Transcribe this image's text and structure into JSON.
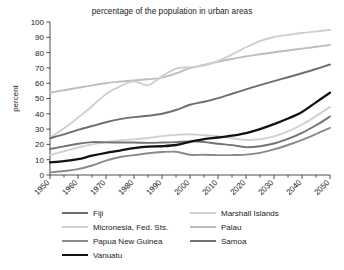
{
  "chart_data": {
    "type": "line",
    "title": "percentage of the population in urban areas",
    "xlabel": "",
    "ylabel": "percent",
    "xlim": [
      1950,
      2050
    ],
    "ylim": [
      0,
      100
    ],
    "ytick_step": 10,
    "xtick_step": 10,
    "minor_xtick_step": 5,
    "grid": false,
    "legend_position": "bottom",
    "yticks": [
      "0",
      "10",
      "20",
      "30",
      "40",
      "50",
      "60",
      "70",
      "80",
      "90",
      "100"
    ],
    "xticks": [
      "1950",
      "1960",
      "1970",
      "1980",
      "1990",
      "2000",
      "2010",
      "2020",
      "2030",
      "2040",
      "2050"
    ],
    "x": [
      1950,
      1955,
      1960,
      1965,
      1970,
      1975,
      1980,
      1985,
      1990,
      1995,
      2000,
      2005,
      2010,
      2015,
      2020,
      2025,
      2030,
      2035,
      2040,
      2045,
      2050
    ],
    "series": [
      {
        "name": "Fiji",
        "color": "#6e6e6e",
        "values": [
          24.0,
          26.5,
          29.5,
          32.0,
          34.5,
          36.5,
          37.8,
          38.7,
          40.0,
          42.5,
          45.9,
          47.9,
          50.3,
          53.1,
          56.0,
          58.8,
          61.4,
          63.9,
          66.5,
          69.3,
          72.2
        ]
      },
      {
        "name": "Micronesia, Fed. Sts.",
        "color": "#d0d0d0",
        "values": [
          13.0,
          15.5,
          18.0,
          20.0,
          21.5,
          22.5,
          23.3,
          24.2,
          25.4,
          26.2,
          26.6,
          26.0,
          25.4,
          24.0,
          22.9,
          23.4,
          25.2,
          28.5,
          33.0,
          38.5,
          44.5
        ]
      },
      {
        "name": "Papua New Guinea",
        "color": "#8a8a8a",
        "values": [
          1.7,
          2.6,
          3.8,
          6.2,
          9.4,
          11.8,
          13.0,
          14.2,
          15.0,
          15.2,
          13.2,
          13.2,
          13.0,
          13.0,
          13.3,
          14.5,
          16.7,
          19.6,
          23.0,
          26.8,
          30.8
        ]
      },
      {
        "name": "Vanuatu",
        "color": "#111111",
        "values": [
          8.3,
          9.0,
          10.3,
          12.6,
          14.5,
          16.0,
          17.5,
          18.5,
          18.8,
          19.6,
          21.7,
          23.5,
          24.5,
          25.7,
          27.4,
          30.0,
          33.2,
          36.9,
          41.2,
          47.5,
          53.8
        ]
      },
      {
        "name": "Marshall Islands",
        "color": "#cfcfcf",
        "values": [
          24.3,
          30.5,
          37.5,
          45.0,
          53.0,
          58.0,
          61.2,
          58.7,
          64.5,
          69.5,
          70.4,
          71.5,
          74.6,
          78.8,
          83.5,
          87.5,
          90.2,
          91.6,
          92.8,
          93.9,
          94.8
        ]
      },
      {
        "name": "Palau",
        "color": "#bdbdbd",
        "values": [
          53.8,
          55.4,
          57.0,
          58.6,
          60.0,
          61.0,
          61.8,
          62.6,
          63.6,
          66.4,
          69.8,
          72.0,
          74.0,
          75.8,
          77.5,
          78.9,
          80.2,
          81.4,
          82.6,
          83.8,
          85.0
        ]
      },
      {
        "name": "Samoa",
        "color": "#737373",
        "values": [
          17.0,
          18.7,
          20.4,
          21.5,
          21.3,
          21.2,
          21.2,
          21.0,
          21.2,
          21.5,
          22.0,
          21.6,
          20.4,
          19.5,
          18.2,
          18.8,
          20.6,
          23.6,
          27.5,
          32.5,
          38.2
        ]
      }
    ]
  },
  "legend": {
    "columns": [
      {
        "items": [
          {
            "label": "Fiji",
            "color": "#6e6e6e",
            "width": 2.0
          },
          {
            "label": "Micronesia, Fed. Sts.",
            "color": "#d0d0d0",
            "width": 2.0
          },
          {
            "label": "Papua New Guinea",
            "color": "#8a8a8a",
            "width": 2.0
          },
          {
            "label": "Vanuatu",
            "color": "#111111",
            "width": 2.4
          }
        ]
      },
      {
        "items": [
          {
            "label": "Marshall Islands",
            "color": "#cfcfcf",
            "width": 2.0
          },
          {
            "label": "Palau",
            "color": "#bdbdbd",
            "width": 2.0
          },
          {
            "label": "Samoa",
            "color": "#737373",
            "width": 2.0
          }
        ]
      }
    ]
  }
}
